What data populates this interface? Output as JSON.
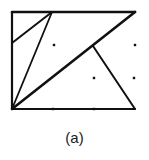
{
  "figure": {
    "caption": "(a)",
    "stroke_color": "#111111",
    "background": "#ffffff",
    "frame": {
      "x1": 12,
      "y1": 12,
      "x2": 135,
      "y2": 109
    },
    "segments": [
      {
        "name": "top-edge",
        "x1": 12,
        "y1": 12,
        "x2": 135,
        "y2": 12,
        "width": 2.6
      },
      {
        "name": "left-edge",
        "x1": 12,
        "y1": 12,
        "x2": 12,
        "y2": 109,
        "width": 2.2
      },
      {
        "name": "bottom-edge",
        "x1": 12,
        "y1": 109,
        "x2": 135,
        "y2": 109,
        "width": 2.2
      },
      {
        "name": "main-diagonal",
        "x1": 12,
        "y1": 109,
        "x2": 135,
        "y2": 12,
        "width": 2.6
      },
      {
        "name": "steep-diagonal",
        "x1": 12,
        "y1": 109,
        "x2": 52,
        "y2": 12,
        "width": 1.8
      },
      {
        "name": "corner-diagonal",
        "x1": 12,
        "y1": 43,
        "x2": 52,
        "y2": 12,
        "width": 2.0
      },
      {
        "name": "branch-line",
        "x1": 93,
        "y1": 46,
        "x2": 135,
        "y2": 109,
        "width": 2.0
      }
    ],
    "dots": [
      {
        "x": 54,
        "y": 45
      },
      {
        "x": 135,
        "y": 45
      },
      {
        "x": 94,
        "y": 78
      },
      {
        "x": 134,
        "y": 78
      },
      {
        "x": 53,
        "y": 109
      },
      {
        "x": 94,
        "y": 109
      }
    ]
  }
}
